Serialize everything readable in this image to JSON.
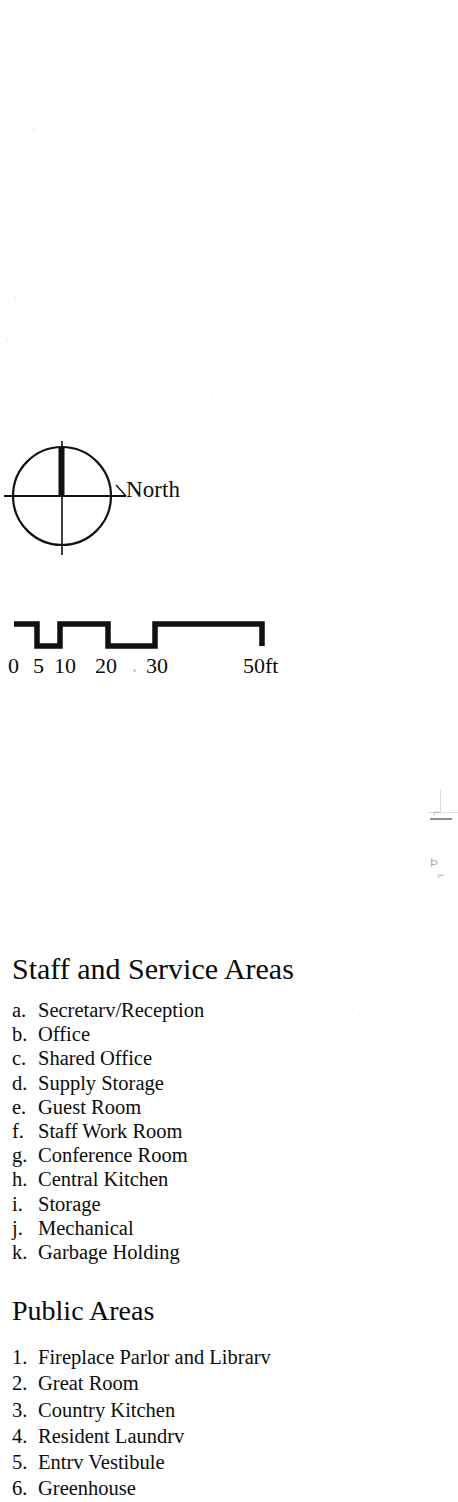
{
  "page": {
    "background_color": "#ffffff",
    "ink_color": "#0d0d0d",
    "width": 458,
    "height": 1502
  },
  "north_arrow": {
    "icon": "north-compass-icon",
    "label": "North",
    "description": "circle with crosshair and thick north bar"
  },
  "scale_bar": {
    "icon": "scale-bar-icon",
    "style": "castellated square-wave bar",
    "labels": [
      {
        "text": "0",
        "key": "sl-0"
      },
      {
        "text": "5",
        "key": "sl-5"
      },
      {
        "text": "10",
        "key": "sl-10"
      },
      {
        "text": "20",
        "key": "sl-20"
      },
      {
        "text": "30",
        "key": "sl-30"
      },
      {
        "text": "50ft",
        "key": "sl-50"
      }
    ]
  },
  "fragments": {
    "top": "⌐",
    "mid": "Þ",
    "low": "⌐"
  },
  "staff_section": {
    "heading": "Staff and Service Areas",
    "items": [
      {
        "marker": "a.",
        "label": "Secretarv/Reception"
      },
      {
        "marker": "b.",
        "label": "Office"
      },
      {
        "marker": "c.",
        "label": "Shared Office"
      },
      {
        "marker": "d.",
        "label": "Supply Storage"
      },
      {
        "marker": "e.",
        "label": "Guest Room"
      },
      {
        "marker": "f.",
        "label": "Staff Work Room"
      },
      {
        "marker": "g.",
        "label": "Conference Room"
      },
      {
        "marker": "h.",
        "label": "Central Kitchen"
      },
      {
        "marker": "i.",
        "label": "Storage"
      },
      {
        "marker": "j.",
        "label": "Mechanical"
      },
      {
        "marker": "k.",
        "label": "Garbage Holding"
      }
    ]
  },
  "public_section": {
    "heading": "Public Areas",
    "items": [
      {
        "marker": "1.",
        "label": "Fireplace Parlor and Librarv"
      },
      {
        "marker": "2.",
        "label": "Great Room"
      },
      {
        "marker": "3.",
        "label": "Country Kitchen"
      },
      {
        "marker": "4.",
        "label": "Resident Laundrv"
      },
      {
        "marker": "5.",
        "label": "Entrv Vestibule"
      },
      {
        "marker": "6.",
        "label": "Greenhouse"
      }
    ]
  }
}
